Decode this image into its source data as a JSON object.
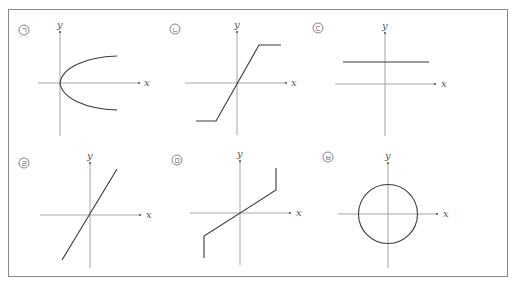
{
  "figure": {
    "border_color": "#8a8a8a",
    "axis_color": "#9a9a9a",
    "curve_color": "#3a3a3a"
  },
  "panels": [
    {
      "marker": "ㄱ",
      "x_label": "x",
      "y_label": "y",
      "description": "parabola opening to the right, vertex at origin (x = y²)"
    },
    {
      "marker": "ㄴ",
      "x_label": "x",
      "y_label": "y",
      "description": "linear through origin, saturating to horizontal lines at both ends"
    },
    {
      "marker": "ㄷ",
      "x_label": "x",
      "y_label": "y",
      "description": "horizontal line above the x-axis (y = constant)"
    },
    {
      "marker": "ㄹ",
      "x_label": "x",
      "y_label": "y",
      "description": "straight line through origin with positive slope"
    },
    {
      "marker": "ㅁ",
      "x_label": "x",
      "y_label": "y",
      "description": "line through origin with vertical segments at both ends"
    },
    {
      "marker": "ㅂ",
      "x_label": "x",
      "y_label": "y",
      "description": "circle centered at origin"
    }
  ]
}
